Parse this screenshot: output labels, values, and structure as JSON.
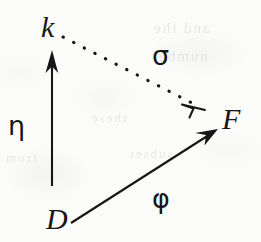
{
  "diagram": {
    "kind": "commutative-triangle",
    "ink_color": "#161616",
    "paper_color": "#fbfbfa",
    "nodes": [
      {
        "id": "k",
        "label": "k",
        "x": 52,
        "y": 30
      },
      {
        "id": "F",
        "label": "F",
        "x": 233,
        "y": 122
      },
      {
        "id": "D",
        "label": "D",
        "x": 58,
        "y": 222
      }
    ],
    "edges": [
      {
        "id": "eta",
        "label": "η",
        "from": "D",
        "to": "k",
        "style": "solid",
        "arrowhead": "open",
        "label_x": 18,
        "label_y": 126
      },
      {
        "id": "sigma",
        "label": "σ",
        "from": "k",
        "to": "F",
        "style": "dotted",
        "arrowhead": "open",
        "label_x": 164,
        "label_y": 56
      },
      {
        "id": "phi",
        "label": "φ",
        "from": "D",
        "to": "F",
        "style": "solid",
        "arrowhead": "open",
        "label_x": 164,
        "label_y": 199
      }
    ]
  },
  "page_bleedthrough": {
    "note": "faint mirrored ink showing through from the reverse side of the scanned page",
    "lines": [
      "and the",
      "number",
      "these",
      "from",
      "subset"
    ]
  }
}
